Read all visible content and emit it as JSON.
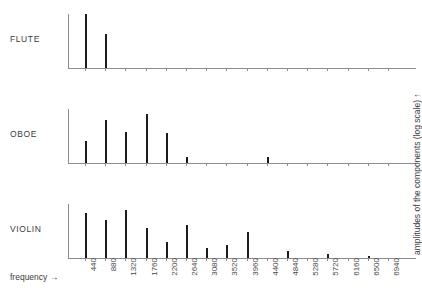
{
  "figure": {
    "xaxis_title": "frequency →",
    "yaxis_title": "amplitudes of the components (log scale) ↑",
    "bar_color": "#1c1c1c",
    "axis_color": "#8d8d8d"
  },
  "panels": [
    {
      "label": "FLUTE"
    },
    {
      "label": "OBOE"
    },
    {
      "label": "VIOLIN"
    }
  ],
  "chart_data": {
    "type": "bar",
    "title": "",
    "xlabel": "frequency →",
    "ylabel": "amplitudes of the components (log scale) ↑",
    "grid": false,
    "legend": "none",
    "categories": [
      440,
      880,
      1320,
      1760,
      2200,
      2640,
      3080,
      3520,
      3960,
      4400,
      4840,
      5280,
      5720,
      6160,
      6500,
      6940
    ],
    "tick_labels": [
      "440",
      "880",
      "1320",
      "1760",
      "2200",
      "2640",
      "3080",
      "3520",
      "3960",
      "4400",
      "4840",
      "5280",
      "5720",
      "6160",
      "6500",
      "6940"
    ],
    "ylim": [
      0,
      100
    ],
    "series": [
      {
        "name": "FLUTE",
        "values": [
          100,
          63,
          0,
          0,
          0,
          0,
          0,
          0,
          0,
          0,
          0,
          0,
          0,
          0,
          0,
          0
        ]
      },
      {
        "name": "OBOE",
        "values": [
          41,
          79,
          57,
          91,
          56,
          11,
          0,
          0,
          0,
          11,
          0,
          0,
          0,
          0,
          0,
          0
        ]
      },
      {
        "name": "VIOLIN",
        "values": [
          84,
          71,
          88,
          55,
          30,
          62,
          18,
          25,
          48,
          0,
          13,
          0,
          7,
          0,
          4,
          0
        ]
      }
    ]
  }
}
